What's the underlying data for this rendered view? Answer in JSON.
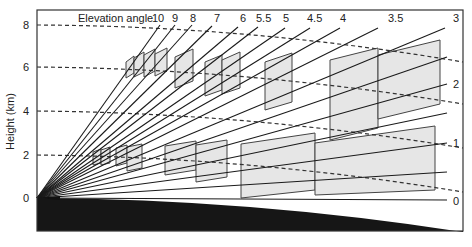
{
  "figure": {
    "y_axis_title": "Height (km)",
    "legend_title": "Elevation angle",
    "y_ticks": [
      {
        "label": "8",
        "y": 25
      },
      {
        "label": "6",
        "y": 67
      },
      {
        "label": "4",
        "y": 111
      },
      {
        "label": "2",
        "y": 155
      },
      {
        "label": "0",
        "y": 198
      }
    ],
    "top_rays": [
      {
        "label": "10",
        "x2": 160,
        "y2": 25,
        "lx": 152,
        "ly": 22
      },
      {
        "label": "9",
        "x2": 175,
        "y2": 25,
        "lx": 172,
        "ly": 22
      },
      {
        "label": "8",
        "x2": 192,
        "y2": 25,
        "lx": 190,
        "ly": 22
      },
      {
        "label": "7",
        "x2": 212,
        "y2": 26,
        "lx": 214,
        "ly": 22
      },
      {
        "label": "6",
        "x2": 238,
        "y2": 27,
        "lx": 240,
        "ly": 22
      },
      {
        "label": "5.5",
        "x2": 258,
        "y2": 27,
        "lx": 256,
        "ly": 22
      },
      {
        "label": "5",
        "x2": 285,
        "y2": 28,
        "lx": 283,
        "ly": 22
      },
      {
        "label": "4.5",
        "x2": 310,
        "y2": 28,
        "lx": 307,
        "ly": 22
      },
      {
        "label": "4",
        "x2": 340,
        "y2": 28,
        "lx": 340,
        "ly": 22
      },
      {
        "label": "3.5",
        "x2": 378,
        "y2": 28,
        "lx": 388,
        "ly": 22
      },
      {
        "label": "3",
        "x2": 445,
        "y2": 28,
        "lx": 453,
        "ly": 22
      }
    ],
    "right_rays": [
      {
        "label": "",
        "x2": 447,
        "y2": 57
      },
      {
        "label": "2",
        "x2": 447,
        "y2": 84,
        "lx": 453,
        "ly": 88
      },
      {
        "label": "",
        "x2": 447,
        "y2": 113
      },
      {
        "label": "1",
        "x2": 447,
        "y2": 143,
        "lx": 453,
        "ly": 147
      },
      {
        "label": "",
        "x2": 447,
        "y2": 172
      },
      {
        "label": "0",
        "x2": 447,
        "y2": 200,
        "lx": 453,
        "ly": 205
      }
    ],
    "dashed_levels": [
      {
        "height_km": "8",
        "y_start": 25,
        "y_end": 62
      },
      {
        "height_km": "6",
        "y_start": 67,
        "y_end": 104
      },
      {
        "height_km": "4",
        "y_start": 111,
        "y_end": 148
      },
      {
        "height_km": "2",
        "y_start": 155,
        "y_end": 192
      }
    ],
    "colors": {
      "frame": "#333333",
      "ray": "#1a1a1a",
      "shade": "#e6e6e6",
      "ground": "#161616",
      "dash": "#333333"
    }
  }
}
